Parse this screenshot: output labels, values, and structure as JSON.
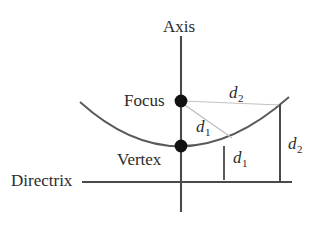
{
  "figure": {
    "kind": "parabola-definition-diagram",
    "background_color": "#ffffff",
    "stroke_color": "#4a4a4a",
    "faint_stroke_color": "#b9b9b9",
    "text_color": "#2b2b2b",
    "point_color": "#111111",
    "labels": {
      "axis": "Axis",
      "focus": "Focus",
      "vertex": "Vertex",
      "directrix": "Directrix",
      "d1_upper_base": "d",
      "d1_upper_sub": "1",
      "d1_lower_base": "d",
      "d1_lower_sub": "1",
      "d2_upper_base": "d",
      "d2_upper_sub": "2",
      "d2_right_base": "d",
      "d2_right_sub": "2"
    },
    "geometry": {
      "axis_x": 181,
      "axis_top_y": 36,
      "axis_bottom_y": 212,
      "focus": [
        181,
        101
      ],
      "vertex": [
        181,
        146
      ],
      "point_on_curve": [
        280,
        105
      ],
      "directrix_y": 182,
      "directrix_x_start": 82,
      "directrix_x_end": 292,
      "curve_left_end": [
        80,
        102
      ],
      "curve_right_end": [
        289,
        97
      ],
      "d1_tick_x": 224,
      "d1_tick_top_y": 146,
      "d1_tick_bottom_y": 180,
      "d2_vertical_x": 280,
      "point_radius": 6
    }
  }
}
